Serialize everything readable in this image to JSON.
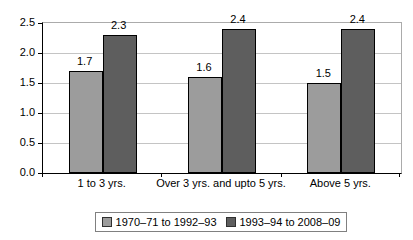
{
  "chart_data": {
    "type": "bar",
    "title": "",
    "xlabel": "",
    "ylabel": "",
    "categories": [
      "1 to 3 yrs.",
      "Over 3 yrs. and upto 5 yrs.",
      "Above 5 yrs."
    ],
    "series": [
      {
        "name": "1970–71 to 1992–93",
        "color": "#9c9c9c",
        "values": [
          1.7,
          1.6,
          1.5
        ]
      },
      {
        "name": "1993–94 to 2008–09",
        "color": "#5e5e5e",
        "values": [
          2.3,
          2.4,
          2.4
        ]
      }
    ],
    "data_labels": [
      [
        "1.7",
        "1.6",
        "1.5"
      ],
      [
        "2.3",
        "2.4",
        "2.4"
      ]
    ],
    "ylim": [
      0,
      2.5
    ],
    "ytick_step": 0.5,
    "ytick_labels": [
      "0.0",
      "0.5",
      "1.0",
      "1.5",
      "2.0",
      "2.5"
    ],
    "grid": true,
    "gridline_color": "#c4c4c4",
    "legend_position": "bottom",
    "bar_border_color": "#000000"
  }
}
